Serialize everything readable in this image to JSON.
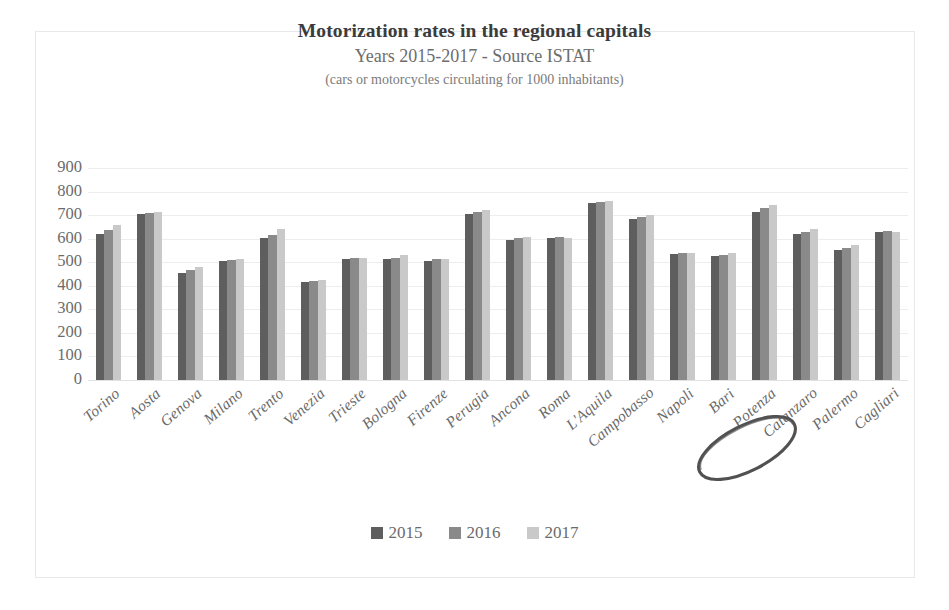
{
  "chart_data": {
    "type": "bar",
    "title": "Motorization rates in the regional capitals",
    "subtitle": "Years 2015-2017 - Source ISTAT",
    "note": "(cars or motorcycles circulating for 1000 inhabitants)",
    "xlabel": "",
    "ylabel": "",
    "ylim": [
      0,
      900
    ],
    "ytick_step": 100,
    "yticks": [
      900,
      800,
      700,
      600,
      500,
      400,
      300,
      200,
      100,
      0
    ],
    "grid": true,
    "legend_position": "bottom",
    "categories": [
      "Torino",
      "Aosta",
      "Genova",
      "Milano",
      "Trento",
      "Venezia",
      "Trieste",
      "Bologna",
      "Firenze",
      "Perugia",
      "Ancona",
      "Roma",
      "L'Aquila",
      "Campobasso",
      "Napoli",
      "Bari",
      "Potenza",
      "Catanzaro",
      "Palermo",
      "Cagliari"
    ],
    "series": [
      {
        "name": "2015",
        "color": "#5e5e5e",
        "values": [
          620,
          705,
          455,
          505,
          605,
          415,
          515,
          515,
          505,
          705,
          595,
          605,
          750,
          685,
          535,
          525,
          715,
          620,
          550,
          630
        ]
      },
      {
        "name": "2016",
        "color": "#8a8a8a",
        "values": [
          635,
          710,
          465,
          510,
          615,
          420,
          520,
          520,
          512,
          715,
          605,
          608,
          755,
          690,
          540,
          532,
          730,
          630,
          560,
          632
        ]
      },
      {
        "name": "2017",
        "color": "#c9c9c9",
        "values": [
          660,
          712,
          480,
          512,
          640,
          425,
          520,
          530,
          515,
          722,
          608,
          605,
          760,
          700,
          540,
          538,
          745,
          640,
          575,
          630
        ]
      }
    ],
    "annotations": [
      {
        "name": "potenza-highlight-circle",
        "shape": "hand-drawn-ellipse",
        "target_label": "Potenza",
        "color": "#4f4f4f"
      }
    ]
  },
  "legend": {
    "items": [
      {
        "label": "2015",
        "color": "#5e5e5e"
      },
      {
        "label": "2016",
        "color": "#8a8a8a"
      },
      {
        "label": "2017",
        "color": "#c9c9c9"
      }
    ]
  }
}
